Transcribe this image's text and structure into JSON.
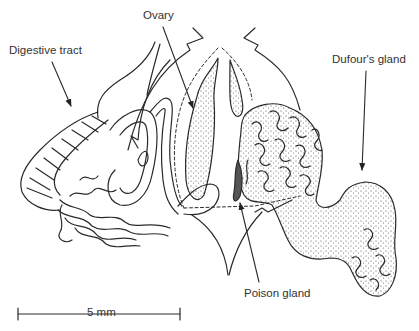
{
  "figure": {
    "background_color": "#ffffff",
    "line_color": "#2a2a2a"
  },
  "labels": {
    "digestive_tract": "Digestive tract",
    "ovary": "Ovary",
    "dufours_gland": "Dufour's gland",
    "poison_gland": "Poison gland"
  },
  "scale_bar": {
    "label": "5 mm",
    "length_px": 162
  }
}
